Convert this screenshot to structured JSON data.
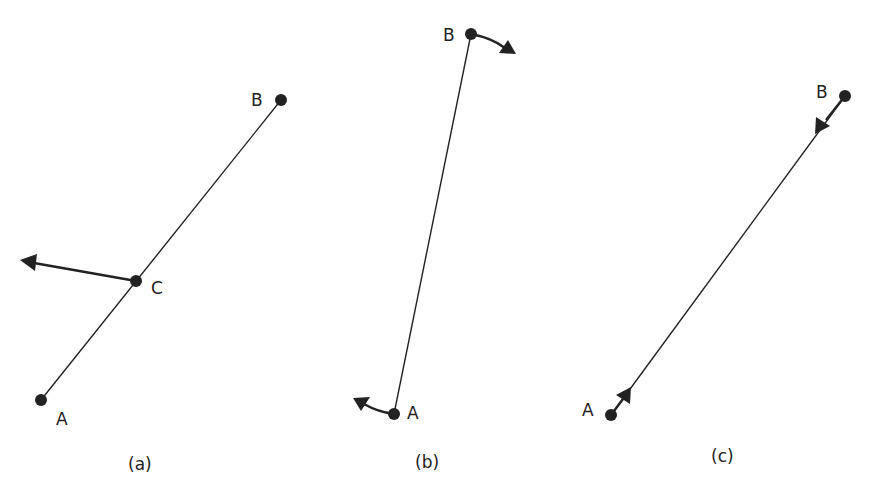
{
  "panels": [
    {
      "caption": "(a)",
      "points": {
        "A": "A",
        "B": "B",
        "C": "C"
      },
      "description": "Rod AB with a force/velocity arrow applied at intermediate point C"
    },
    {
      "caption": "(b)",
      "points": {
        "A": "A",
        "B": "B"
      },
      "description": "Rod AB with curved rotation arrows at both ends"
    },
    {
      "caption": "(c)",
      "points": {
        "A": "A",
        "B": "B"
      },
      "description": "Rod AB with inward-pointing arrows along the rod at both ends"
    }
  ],
  "colors": {
    "ink": "#222222",
    "background": "#ffffff"
  }
}
